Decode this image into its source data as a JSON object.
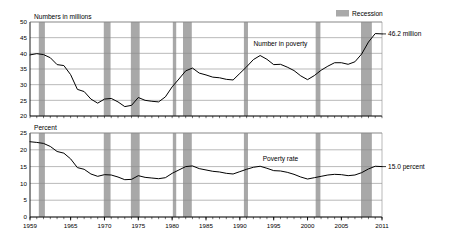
{
  "legend": {
    "label": "Recession",
    "swatch_color": "#a9a9a9"
  },
  "colors": {
    "recession_band": "#a8a8a8",
    "gridline": "#8a8a8a",
    "axis": "#000000",
    "series_line": "#000000",
    "background": "#ffffff"
  },
  "chart_data": [
    {
      "type": "line",
      "title": "",
      "ylabel": "Numbers in millions",
      "xlabel": "",
      "ylim": [
        20,
        50
      ],
      "yticks": [
        20,
        25,
        30,
        35,
        40,
        45,
        50
      ],
      "xlim": [
        1959,
        2011
      ],
      "xticks": [
        1959,
        1965,
        1970,
        1975,
        1980,
        1985,
        1990,
        1995,
        2000,
        2005,
        2011
      ],
      "grid": true,
      "legend_position": "top-right",
      "annotation_series": "Number in poverty",
      "annotation_end": "46.2 million",
      "series": [
        {
          "name": "Number in poverty",
          "x": [
            1959,
            1960,
            1961,
            1962,
            1963,
            1964,
            1965,
            1966,
            1967,
            1968,
            1969,
            1970,
            1971,
            1972,
            1973,
            1974,
            1975,
            1976,
            1977,
            1978,
            1979,
            1980,
            1981,
            1982,
            1983,
            1984,
            1985,
            1986,
            1987,
            1988,
            1989,
            1990,
            1991,
            1992,
            1993,
            1994,
            1995,
            1996,
            1997,
            1998,
            1999,
            2000,
            2001,
            2002,
            2003,
            2004,
            2005,
            2006,
            2007,
            2008,
            2009,
            2010,
            2011
          ],
          "values": [
            39.5,
            39.9,
            39.6,
            38.6,
            36.4,
            36.1,
            33.2,
            28.5,
            27.8,
            25.4,
            24.1,
            25.4,
            25.6,
            24.5,
            23.0,
            23.4,
            25.9,
            25.0,
            24.7,
            24.5,
            26.1,
            29.3,
            31.8,
            34.4,
            35.3,
            33.7,
            33.1,
            32.4,
            32.2,
            31.7,
            31.5,
            33.6,
            35.7,
            38.0,
            39.3,
            38.1,
            36.4,
            36.5,
            35.6,
            34.5,
            32.8,
            31.6,
            32.9,
            34.6,
            35.9,
            37.0,
            37.0,
            36.5,
            37.3,
            39.8,
            43.6,
            46.3,
            46.2
          ]
        }
      ],
      "recessions": [
        {
          "start": 1960.3,
          "end": 1961.2
        },
        {
          "start": 1969.9,
          "end": 1970.9
        },
        {
          "start": 1973.9,
          "end": 1975.2
        },
        {
          "start": 1980.1,
          "end": 1980.6
        },
        {
          "start": 1981.6,
          "end": 1982.9
        },
        {
          "start": 1990.6,
          "end": 1991.2
        },
        {
          "start": 2001.2,
          "end": 2001.9
        },
        {
          "start": 2007.9,
          "end": 2009.5
        }
      ]
    },
    {
      "type": "line",
      "title": "",
      "ylabel": "Percent",
      "xlabel": "",
      "ylim": [
        0,
        25
      ],
      "yticks": [
        0,
        5,
        10,
        15,
        20,
        25
      ],
      "xlim": [
        1959,
        2011
      ],
      "xticks": [
        1959,
        1965,
        1970,
        1975,
        1980,
        1985,
        1990,
        1995,
        2000,
        2005,
        2011
      ],
      "grid": true,
      "annotation_series": "Poverty rate",
      "annotation_end": "15.0 percent",
      "series": [
        {
          "name": "Poverty rate",
          "x": [
            1959,
            1960,
            1961,
            1962,
            1963,
            1964,
            1965,
            1966,
            1967,
            1968,
            1969,
            1970,
            1971,
            1972,
            1973,
            1974,
            1975,
            1976,
            1977,
            1978,
            1979,
            1980,
            1981,
            1982,
            1983,
            1984,
            1985,
            1986,
            1987,
            1988,
            1989,
            1990,
            1991,
            1992,
            1993,
            1994,
            1995,
            1996,
            1997,
            1998,
            1999,
            2000,
            2001,
            2002,
            2003,
            2004,
            2005,
            2006,
            2007,
            2008,
            2009,
            2010,
            2011
          ],
          "values": [
            22.4,
            22.2,
            21.9,
            21.0,
            19.5,
            19.0,
            17.3,
            14.7,
            14.2,
            12.8,
            12.1,
            12.6,
            12.5,
            11.9,
            11.1,
            11.2,
            12.3,
            11.8,
            11.6,
            11.4,
            11.7,
            13.0,
            14.0,
            15.0,
            15.2,
            14.4,
            14.0,
            13.6,
            13.4,
            13.0,
            12.8,
            13.5,
            14.2,
            14.8,
            15.1,
            14.5,
            13.8,
            13.7,
            13.3,
            12.7,
            11.9,
            11.3,
            11.7,
            12.1,
            12.5,
            12.7,
            12.6,
            12.3,
            12.5,
            13.2,
            14.3,
            15.1,
            15.0
          ]
        }
      ],
      "recessions": [
        {
          "start": 1960.3,
          "end": 1961.2
        },
        {
          "start": 1969.9,
          "end": 1970.9
        },
        {
          "start": 1973.9,
          "end": 1975.2
        },
        {
          "start": 1980.1,
          "end": 1980.6
        },
        {
          "start": 1981.6,
          "end": 1982.9
        },
        {
          "start": 1990.6,
          "end": 1991.2
        },
        {
          "start": 2001.2,
          "end": 2001.9
        },
        {
          "start": 2007.9,
          "end": 2009.5
        }
      ]
    }
  ]
}
